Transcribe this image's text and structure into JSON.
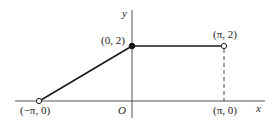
{
  "diagram": {
    "type": "piecewise-function-graph",
    "axes": {
      "x_label": "x",
      "y_label": "y",
      "origin_label": "O"
    },
    "points": [
      {
        "label": "(−π, 0)",
        "x": "-pi",
        "y": 0,
        "marker": "open"
      },
      {
        "label": "(0, 2)",
        "x": 0,
        "y": 2,
        "marker": "filled"
      },
      {
        "label": "(π, 2)",
        "x": "pi",
        "y": 2,
        "marker": "open"
      },
      {
        "label": "(π, 0)",
        "x": "pi",
        "y": 0,
        "marker": "none"
      }
    ],
    "segments": [
      {
        "from": "(−π, 0)",
        "to": "(0, 2)",
        "style": "solid"
      },
      {
        "from": "(0, 2)",
        "to": "(π, 2)",
        "style": "solid"
      },
      {
        "from": "(π, 2)",
        "to": "(π, 0)",
        "style": "dashed"
      }
    ],
    "colors": {
      "line": "#1a1a1a",
      "axis": "#444444",
      "background": "#ffffff"
    }
  }
}
